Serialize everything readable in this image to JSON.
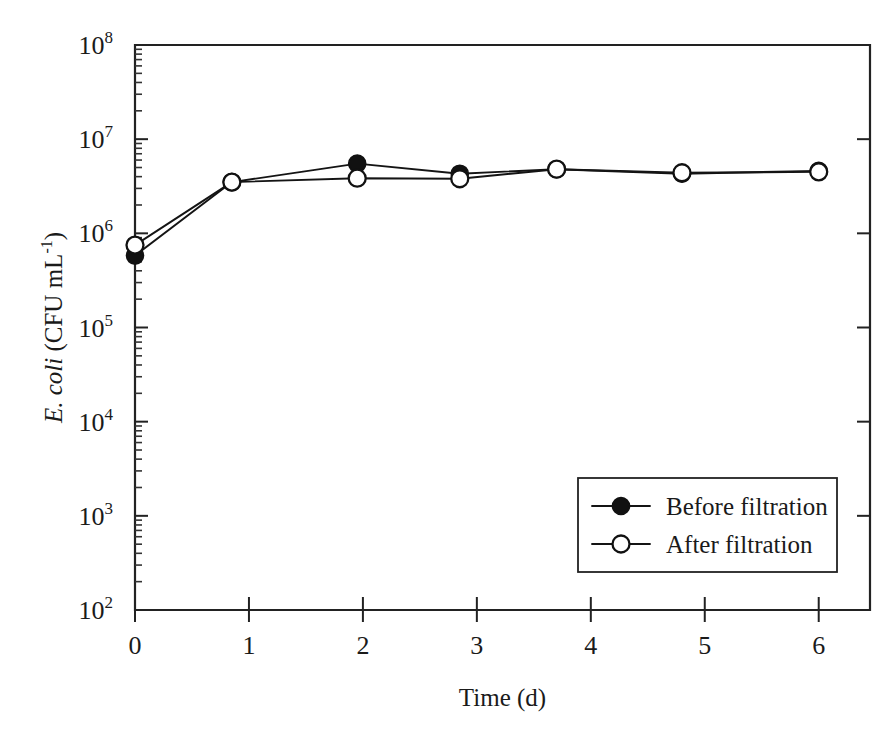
{
  "chart_data": {
    "type": "line",
    "title": "",
    "xlabel": "Time (d)",
    "ylabel": "E. coli (CFU mL-1)",
    "ylabel_parts": {
      "italic": "E. coli",
      "rest": " (CFU mL",
      "superscript": "-1",
      "tail": ")"
    },
    "xlim": [
      0,
      6.45
    ],
    "ylim": [
      100,
      100000000
    ],
    "yscale": "log",
    "grid": false,
    "legend_position": "lower-right",
    "x_ticks": [
      0,
      1,
      2,
      3,
      4,
      5,
      6
    ],
    "x_tick_labels": [
      "0",
      "1",
      "2",
      "3",
      "4",
      "5",
      "6"
    ],
    "y_ticks": [
      100,
      1000,
      10000,
      100000,
      1000000,
      10000000,
      100000000
    ],
    "y_tick_labels": [
      "10²",
      "10³",
      "10⁴",
      "10⁵",
      "10⁶",
      "10⁷",
      "10⁸"
    ],
    "y_tick_mantissa": [
      "10",
      "10",
      "10",
      "10",
      "10",
      "10",
      "10"
    ],
    "y_tick_exponents": [
      "2",
      "3",
      "4",
      "5",
      "6",
      "7",
      "8"
    ],
    "series": [
      {
        "name": "Before filtration",
        "marker": "filled-circle",
        "color": "#111111",
        "x": [
          0.0,
          0.85,
          1.95,
          2.85,
          3.7,
          4.8,
          6.0
        ],
        "y": [
          580000,
          3500000,
          5500000,
          4300000,
          4800000,
          4300000,
          4600000
        ]
      },
      {
        "name": "After filtration",
        "marker": "open-circle",
        "color": "#111111",
        "x": [
          0.0,
          0.85,
          1.95,
          2.85,
          3.7,
          4.8,
          6.0
        ],
        "y": [
          750000,
          3500000,
          3850000,
          3800000,
          4800000,
          4400000,
          4500000
        ]
      }
    ],
    "legend_entries": [
      {
        "label": "Before filtration",
        "marker": "filled-circle"
      },
      {
        "label": "After filtration",
        "marker": "open-circle"
      }
    ]
  }
}
